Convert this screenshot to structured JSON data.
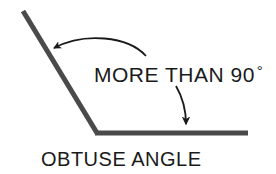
{
  "figure": {
    "title_semantic": "obtuse-angle-diagram",
    "background_color": "#ffffff",
    "stroke_color": "#4a4a4a",
    "annotation_color": "#1a1a1a",
    "text_color": "#1a1a1a"
  },
  "labels": {
    "callout_text": "MORE THAN 90",
    "callout_degree_symbol": "°",
    "caption_text": "OBTUSE ANGLE"
  },
  "geometry": {
    "vertex": {
      "x": 97,
      "y": 133
    },
    "left_ray_end": {
      "x": 23,
      "y": 11
    },
    "right_ray_end": {
      "x": 248,
      "y": 133
    },
    "ray_thickness": 5,
    "angle_degrees": 121,
    "angle_classification": "obtuse"
  },
  "annotations": {
    "arc_arrow": {
      "name": "angle-arc-arrow",
      "start": {
        "x": 146,
        "y": 56
      },
      "end": {
        "x": 51,
        "y": 50
      },
      "points_to": "angle-interior-at-left-ray"
    },
    "baseline_arrow": {
      "name": "baseline-pointer-arrow",
      "start": {
        "x": 176,
        "y": 86
      },
      "end": {
        "x": 186,
        "y": 130
      },
      "points_to": "horizontal-ray"
    }
  }
}
